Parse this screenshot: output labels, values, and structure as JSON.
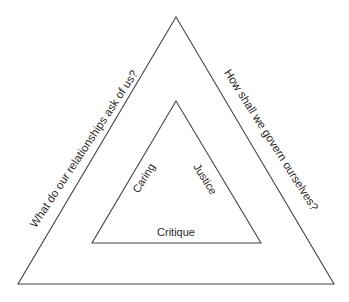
{
  "diagram": {
    "type": "nested-triangles",
    "outer_triangle": {
      "points": [
        [
          176,
          17
        ],
        [
          18,
          284
        ],
        [
          334,
          284
        ]
      ],
      "left_edge_label": "What do our relationships ask of us?",
      "right_edge_label": "How shall we govern ourselves?"
    },
    "inner_triangle": {
      "points": [
        [
          176,
          101
        ],
        [
          92,
          243
        ],
        [
          261,
          243
        ]
      ],
      "left_edge_label": "Caring",
      "right_edge_label": "Justice",
      "bottom_edge_label": "Critique"
    },
    "colors": {
      "stroke": "#444444",
      "text": "#2a2a2a",
      "background": "#ffffff"
    }
  }
}
